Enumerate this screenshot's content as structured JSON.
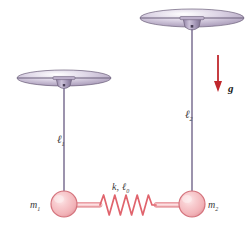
{
  "figure": {
    "type": "physics-diagram",
    "width": 252,
    "height": 228,
    "background": "#ffffff"
  },
  "colors": {
    "ceiling_fill": "#cfc4da",
    "ceiling_edge": "#6b5f7a",
    "mount_fill": "#a89ab8",
    "mount_edge": "#6b5f7a",
    "string": "#7b6f92",
    "mass_fill": "#f4b9bd",
    "mass_edge": "#d4737c",
    "mass_highlight": "#fbe0e2",
    "spring": "#e06a72",
    "rod_fill": "#f6c3c6",
    "gravity_arrow": "#c0282d",
    "label_text": "#3a3a3a"
  },
  "labels": {
    "length_1": "ℓ",
    "length_1_sub": "1",
    "length_2": "ℓ",
    "length_2_sub": "2",
    "mass_1": "m",
    "mass_1_sub": "1",
    "mass_2": "m",
    "mass_2_sub": "2",
    "spring_k": "k,",
    "spring_l0": "ℓ",
    "spring_l0_sub": "0",
    "gravity": "g"
  },
  "geometry": {
    "pendulum_1": {
      "pivot_x": 64,
      "pivot_y": 82,
      "bob_x": 64,
      "bob_y": 204,
      "bob_radius": 13
    },
    "pendulum_2": {
      "pivot_x": 192,
      "pivot_y": 22,
      "bob_x": 192,
      "bob_y": 204,
      "bob_radius": 13
    },
    "spring": {
      "x_start": 100,
      "x_end": 156,
      "y": 205,
      "coils": 5
    },
    "gravity_arrow": {
      "x": 218,
      "y_start": 55,
      "y_end": 90
    }
  }
}
